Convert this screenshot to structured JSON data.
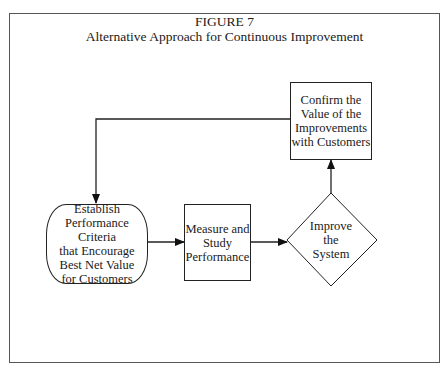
{
  "figure": {
    "number": "FIGURE 7",
    "title": "Alternative Approach for Continuous Improvement"
  },
  "nodes": {
    "establish": {
      "shape": "rounded-rectangle",
      "text": "Establish\nPerformance Criteria\nthat Encourage\nBest Net Value\nfor Customers"
    },
    "measure": {
      "shape": "rectangle",
      "text": "Measure and\nStudy\nPerformance"
    },
    "improve": {
      "shape": "diamond",
      "text": "Improve\nthe\nSystem"
    },
    "confirm": {
      "shape": "rectangle",
      "text": "Confirm the\nValue of the\nImprovements\nwith Customers"
    }
  },
  "edges": [
    {
      "from": "establish",
      "to": "measure"
    },
    {
      "from": "measure",
      "to": "improve"
    },
    {
      "from": "improve",
      "to": "confirm"
    },
    {
      "from": "confirm",
      "to": "establish"
    }
  ],
  "colors": {
    "line": "#222222",
    "frame": "#555555",
    "background": "#ffffff"
  }
}
